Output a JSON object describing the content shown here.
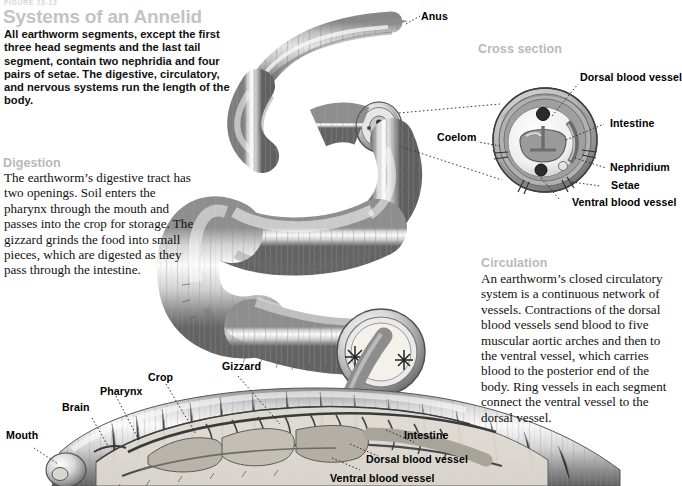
{
  "header": {
    "kicker": "FIGURE 23-12",
    "title": "Systems of an Annelid",
    "intro": "All earthworm segments, except the first three head segments and the last tail segment, contain two nephridia and four pairs of setae. The digestive, circulatory, and nervous systems run the length of the body."
  },
  "sections": [
    {
      "id": "digestion",
      "heading": "Digestion",
      "body": "The earthworm’s digestive tract has two openings. Soil enters the pharynx through the mouth and passes into the crop for storage. The gizzard grinds the food into small pieces, which are digested as they pass through the intestine."
    },
    {
      "id": "circulation",
      "heading": "Circulation",
      "body": "An earthworm’s closed circulatory system is a continuous network of vessels. Contractions of the dorsal blood vessels send blood to five muscular aortic arches and then to the ventral vessel, which carries blood to the posterior end of the body. Ring vessels in each segment connect the ventral vessel to the dorsal vessel."
    }
  ],
  "cross_section": {
    "heading": "Cross section",
    "labels": {
      "dorsal_blood_vessel": "Dorsal blood vessel",
      "intestine": "Intestine",
      "nephridium": "Nephridium",
      "setae": "Setae",
      "ventral_blood_vessel": "Ventral blood vessel",
      "coelom": "Coelom"
    }
  },
  "worm_labels": {
    "anus": "Anus",
    "mouth": "Mouth",
    "brain": "Brain",
    "pharynx": "Pharynx",
    "crop": "Crop",
    "gizzard": "Gizzard",
    "intestine": "Intestine",
    "dorsal_blood_vessel": "Dorsal blood vessel",
    "ventral_blood_vessel": "Ventral blood vessel"
  },
  "colors": {
    "title": "#c3c3c3",
    "section_heading": "#b9b9b9",
    "label": "#000000",
    "body_text": "#111111",
    "background": "#ffffff",
    "worm_light": "#f1f1f1",
    "worm_mid": "#9a9a9a",
    "worm_dark": "#4a4a4a"
  }
}
